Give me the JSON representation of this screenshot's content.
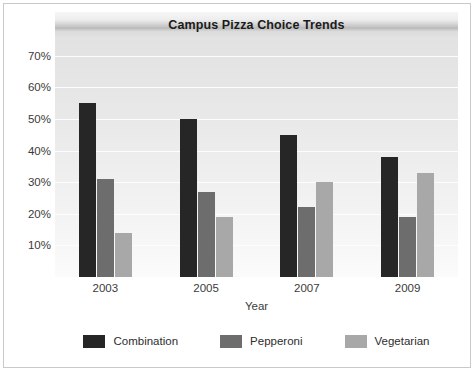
{
  "chart_data": {
    "type": "bar",
    "title": "Campus Pizza Choice Trends",
    "xlabel": "Year",
    "ylabel": "",
    "categories": [
      "2003",
      "2005",
      "2007",
      "2009"
    ],
    "series": [
      {
        "name": "Combination",
        "color": "#262626",
        "values": [
          55,
          50,
          45,
          38
        ]
      },
      {
        "name": "Pepperoni",
        "color": "#6d6d6d",
        "values": [
          31,
          27,
          22,
          19
        ]
      },
      {
        "name": "Vegetarian",
        "color": "#a8a8a8",
        "values": [
          14,
          19,
          30,
          33
        ]
      }
    ],
    "ylim": [
      0,
      75
    ],
    "yticks": [
      10,
      20,
      30,
      40,
      50,
      60,
      70
    ],
    "ytick_labels": [
      "10%",
      "20%",
      "30%",
      "40%",
      "50%",
      "60%",
      "70%"
    ],
    "grid": true,
    "legend_position": "bottom",
    "value_suffix": "%"
  }
}
